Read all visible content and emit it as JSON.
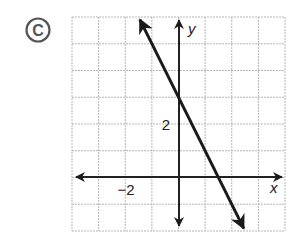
{
  "figure": {
    "option_label": "C",
    "option_marker": "circled-letter",
    "axis_labels": {
      "x": "x",
      "y": "y"
    },
    "tick_labels": {
      "x": "−2",
      "y": "2"
    }
  },
  "chart_data": {
    "type": "line",
    "title": "",
    "xlabel": "x",
    "ylabel": "y",
    "xlim": [
      -4,
      4
    ],
    "ylim": [
      -2,
      6
    ],
    "grid": true,
    "grid_step": 1,
    "labeled_ticks": {
      "x": [
        -2
      ],
      "y": [
        2
      ]
    },
    "series": [
      {
        "name": "line",
        "equation": "y = -2x + 3",
        "slope": -2,
        "y_intercept": 3,
        "x_intercept": 1.5,
        "x": [
          -1.5,
          2.5
        ],
        "y": [
          6,
          -2
        ],
        "arrows_both_ends": true
      }
    ]
  },
  "colors": {
    "grid": "#b5b5b5",
    "axes": "#222222",
    "line": "#1a1a1a",
    "marker": "#555555"
  }
}
